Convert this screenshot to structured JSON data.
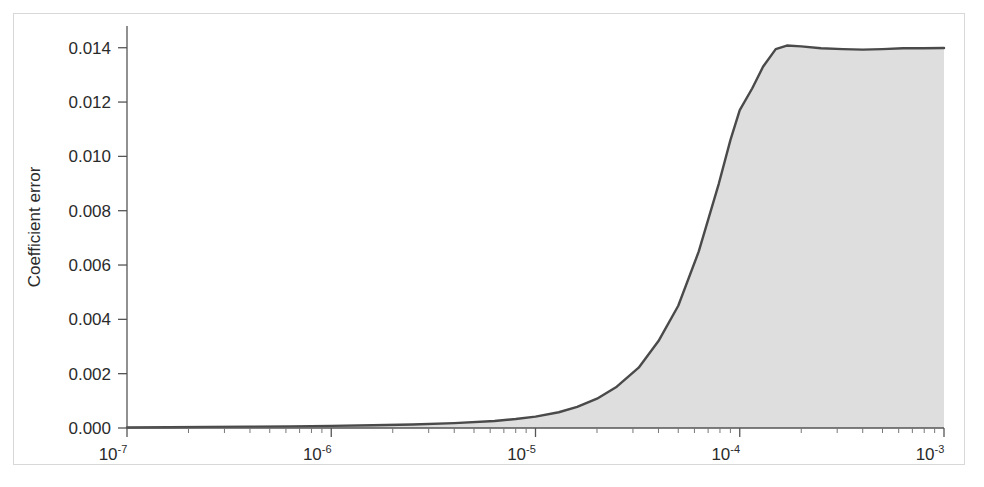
{
  "figure": {
    "background_color": "#ffffff",
    "border_color": "#d8d8d8",
    "line_color": "#4a4a4a",
    "fill_color": "#dedede",
    "axis_color": "#555555"
  },
  "axes": {
    "ylabel": "Coefficient error",
    "y_ticks": [
      "0.000",
      "0.002",
      "0.004",
      "0.006",
      "0.008",
      "0.010",
      "0.012",
      "0.014"
    ],
    "x_tick_bases": [
      "10",
      "10",
      "10",
      "10",
      "10"
    ],
    "x_tick_exponents": [
      "-7",
      "-6",
      "-5",
      "-4",
      "-3"
    ],
    "x_tick_labels": [
      "10⁻⁷",
      "10⁻⁶",
      "10⁻⁵",
      "10⁻⁴",
      "10⁻³"
    ]
  },
  "chart_data": {
    "type": "area",
    "title": "",
    "xlabel": "",
    "ylabel": "Coefficient error",
    "xscale": "log",
    "yscale": "linear",
    "xlim": [
      1e-07,
      0.001
    ],
    "ylim": [
      0.0,
      0.0148
    ],
    "grid": false,
    "legend": null,
    "y_ticks": [
      0.0,
      0.002,
      0.004,
      0.006,
      0.008,
      0.01,
      0.012,
      0.014
    ],
    "x_ticks": [
      1e-07,
      1e-06,
      1e-05,
      0.0001,
      0.001
    ],
    "series": [
      {
        "name": "Coefficient error",
        "filled": true,
        "x": [
          1e-07,
          1.6e-07,
          2.5e-07,
          4e-07,
          6.3e-07,
          1e-06,
          1.6e-06,
          2.5e-06,
          4e-06,
          6.3e-06,
          8e-06,
          1e-05,
          1.3e-05,
          1.6e-05,
          2e-05,
          2.5e-05,
          3.2e-05,
          4e-05,
          5e-05,
          6.3e-05,
          7.9e-05,
          9e-05,
          0.0001,
          0.000115,
          0.00013,
          0.00015,
          0.00017,
          0.0002,
          0.00025,
          0.00032,
          0.0004,
          0.0005,
          0.00063,
          0.00079,
          0.001
        ],
        "y": [
          2e-05,
          3e-05,
          4e-05,
          5e-05,
          6e-05,
          8e-05,
          0.0001,
          0.00013,
          0.00018,
          0.00026,
          0.00033,
          0.00042,
          0.00058,
          0.00078,
          0.00108,
          0.00152,
          0.00222,
          0.0032,
          0.0045,
          0.0065,
          0.009,
          0.0106,
          0.0117,
          0.0125,
          0.0133,
          0.01395,
          0.01408,
          0.01405,
          0.01398,
          0.01395,
          0.01393,
          0.01395,
          0.01398,
          0.01398,
          0.01399
        ]
      }
    ]
  },
  "plot_geometry": {
    "left_px": 127,
    "right_px": 944,
    "top_px": 26,
    "bottom_px": 428
  }
}
